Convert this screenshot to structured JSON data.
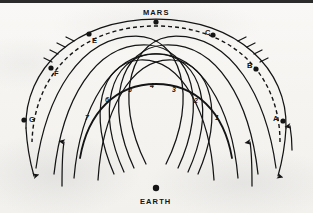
{
  "figure": {
    "name": "mars-earth-transfer-orbit-diagram",
    "background_color": "#f5f4f1",
    "ink_color": "#141414",
    "width": 313,
    "height": 213
  },
  "bodies": [
    {
      "id": "mars",
      "label": "MARS",
      "label_x": 143,
      "label_y": 9,
      "dot_x": 156,
      "dot_y": 22,
      "dot_r": 2.6
    },
    {
      "id": "earth",
      "label": "EARTH",
      "label_x": 140,
      "label_y": 198,
      "dot_x": 156,
      "dot_y": 188,
      "dot_r": 3.2
    }
  ],
  "points": [
    {
      "id": "A",
      "label": "A",
      "label_x": 273,
      "label_y": 119,
      "dot_x": 283,
      "dot_y": 121
    },
    {
      "id": "B",
      "label": "B",
      "label_x": 247,
      "label_y": 65,
      "dot_x": 256,
      "dot_y": 69
    },
    {
      "id": "C",
      "label": "C",
      "label_x": 205,
      "label_y": 32,
      "dot_x": 213,
      "dot_y": 35
    },
    {
      "id": "E",
      "label": "E",
      "label_x": 92,
      "label_y": 40,
      "dot_x": 89,
      "dot_y": 34
    },
    {
      "id": "F",
      "label": "F",
      "label_x": 54,
      "label_y": 73,
      "dot_x": 51,
      "dot_y": 68
    },
    {
      "id": "G",
      "label": "G",
      "label_x": 29,
      "label_y": 119,
      "dot_x": 24,
      "dot_y": 120
    }
  ],
  "numbers": [
    {
      "label": "1",
      "x": 215,
      "y": 118
    },
    {
      "label": "2",
      "x": 194,
      "y": 101
    },
    {
      "label": "3",
      "x": 172,
      "y": 90
    },
    {
      "label": "4",
      "x": 150,
      "y": 86
    },
    {
      "label": "5",
      "x": 128,
      "y": 90
    },
    {
      "label": "6",
      "x": 105,
      "y": 100
    },
    {
      "label": "7",
      "x": 85,
      "y": 118
    }
  ],
  "frame": {
    "top_rule_color": "#2b2b2b",
    "top_rule_height": 3
  }
}
